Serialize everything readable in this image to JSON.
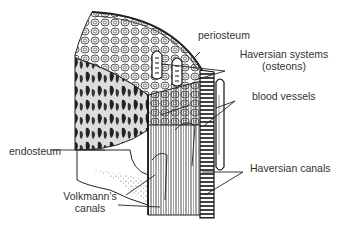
{
  "diagram": {
    "labels": {
      "periosteum": "periosteum",
      "haversian_systems_1": "Haversian systems",
      "haversian_systems_2": "(osteons)",
      "blood_vessels": "blood vessels",
      "endosteum": "endosteum",
      "haversian_canals": "Haversian canals",
      "volkmanns_canals_1": "Volkmann's",
      "volkmanns_canals_2": "canals"
    },
    "colors": {
      "ink": "#222222",
      "label_text": "#333333",
      "background": "#ffffff"
    }
  }
}
